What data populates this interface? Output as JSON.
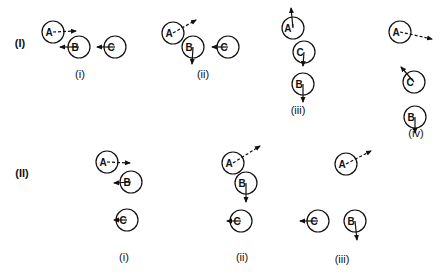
{
  "rows": [
    {
      "label": "(I)",
      "label_pos": [
        20,
        47
      ],
      "panels": [
        {
          "label": "(i)",
          "label_pos": [
            80,
            78
          ],
          "balls": [
            {
              "name": "A",
              "cx": 53,
              "cy": 32,
              "arrow": {
                "to": [
                  76,
                  31
                ],
                "dashed": true,
                "from_label": true
              }
            },
            {
              "name": "B",
              "cx": 79,
              "cy": 47,
              "arrow": {
                "to": [
                  60,
                  47
                ],
                "dashed": false
              }
            },
            {
              "name": "C",
              "cx": 115,
              "cy": 47,
              "arrow": {
                "to": [
                  97,
                  47
                ],
                "dashed": false
              }
            }
          ]
        },
        {
          "label": "(ii)",
          "label_pos": [
            203,
            78
          ],
          "balls": [
            {
              "name": "A",
              "cx": 173,
              "cy": 33,
              "arrow": {
                "to": [
                  196,
                  20
                ],
                "dashed": true
              }
            },
            {
              "name": "B",
              "cx": 193,
              "cy": 47,
              "arrow": {
                "to": [
                  192,
                  64
                ],
                "dashed": false
              }
            },
            {
              "name": "C",
              "cx": 228,
              "cy": 47,
              "arrow": {
                "to": [
                  212,
                  47
                ],
                "dashed": false
              }
            }
          ]
        },
        {
          "label": "(iii)",
          "label_pos": [
            298,
            114
          ],
          "balls": [
            {
              "name": "A'",
              "cx": 293,
              "cy": 28,
              "arrow": {
                "to": [
                  291,
                  8
                ],
                "dashed": false
              }
            },
            {
              "name": "C",
              "cx": 304,
              "cy": 52,
              "arrow": {
                "to": [
                  303,
                  66
                ],
                "dashed": false
              }
            },
            {
              "name": "B",
              "cx": 303,
              "cy": 84,
              "arrow": {
                "to": [
                  303,
                  102
                ],
                "dashed": false
              }
            }
          ]
        },
        {
          "label": "(iv)",
          "label_pos": [
            416,
            137
          ],
          "balls": [
            {
              "name": "A",
              "cx": 400,
              "cy": 32,
              "arrow": {
                "to": [
                  432,
                  39
                ],
                "dashed": true
              }
            },
            {
              "name": "C",
              "cx": 414,
              "cy": 82,
              "arrow": {
                "to": [
                  401,
                  67
                ],
                "dashed": false
              }
            },
            {
              "name": "B",
              "cx": 415,
              "cy": 117,
              "arrow": {
                "to": [
                  415,
                  133
                ],
                "dashed": false
              }
            }
          ]
        }
      ]
    },
    {
      "label": "(II)",
      "label_pos": [
        22,
        177
      ],
      "panels": [
        {
          "label": "(i)",
          "label_pos": [
            124,
            261
          ],
          "balls": [
            {
              "name": "A",
              "cx": 107,
              "cy": 162,
              "arrow": {
                "to": [
                  130,
                  163
                ],
                "dashed": true
              }
            },
            {
              "name": "B",
              "cx": 131,
              "cy": 182,
              "arrow": {
                "to": [
                  114,
                  183
                ],
                "dashed": false
              }
            },
            {
              "name": "C",
              "cx": 127,
              "cy": 220,
              "arrow": {
                "to": [
                  114,
                  220
                ],
                "dashed": false
              }
            }
          ]
        },
        {
          "label": "(ii)",
          "label_pos": [
            242,
            261
          ],
          "balls": [
            {
              "name": "A",
              "cx": 233,
              "cy": 163,
              "arrow": {
                "to": [
                  260,
                  146
                ],
                "dashed": true
              }
            },
            {
              "name": "B",
              "cx": 246,
              "cy": 183,
              "arrow": {
                "to": [
                  246,
                  202
                ],
                "dashed": false
              }
            },
            {
              "name": "C",
              "cx": 241,
              "cy": 221,
              "arrow": {
                "to": [
                  227,
                  221
                ],
                "dashed": false
              }
            }
          ]
        },
        {
          "label": "(iii)",
          "label_pos": [
            342,
            263
          ],
          "balls": [
            {
              "name": "A",
              "cx": 346,
              "cy": 164,
              "arrow": {
                "to": [
                  371,
                  151
                ],
                "dashed": true
              }
            },
            {
              "name": "C",
              "cx": 318,
              "cy": 221,
              "arrow": {
                "to": [
                  300,
                  221
                ],
                "dashed": false
              }
            },
            {
              "name": "B",
              "cx": 355,
              "cy": 221,
              "arrow": {
                "to": [
                  357,
                  240
                ],
                "dashed": false
              }
            }
          ]
        }
      ]
    }
  ],
  "style": {
    "ink": "#111111",
    "radius": 11
  }
}
